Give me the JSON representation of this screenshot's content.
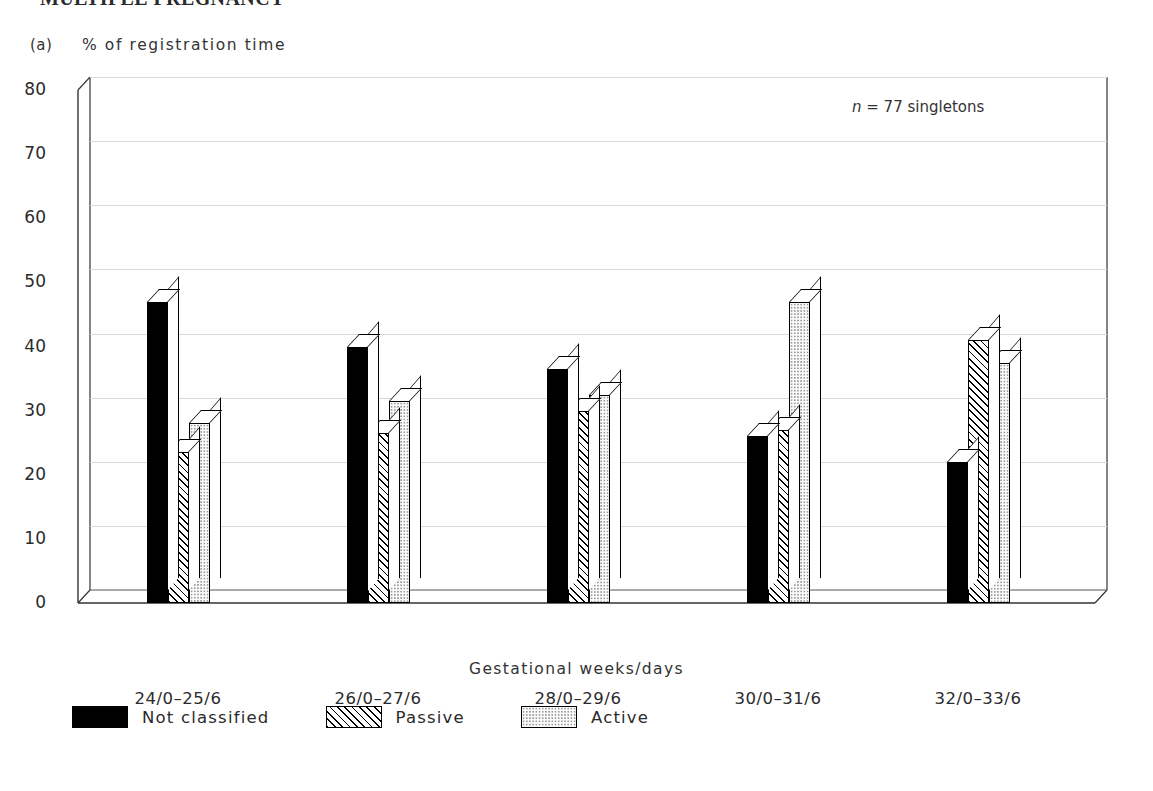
{
  "running_head": "MULTIPLE PREGNANCY",
  "panel_label": "(a)",
  "annotation": {
    "symbol": "n",
    "rest": " = 77 singletons"
  },
  "legend": {
    "items": [
      {
        "label": "Not classified",
        "pattern": "solid-black"
      },
      {
        "label": "Passive",
        "pattern": "diagonal-hatch"
      },
      {
        "label": "Active",
        "pattern": "light-dotted"
      }
    ]
  },
  "chart_data": {
    "type": "bar",
    "title": "",
    "subtitle": "",
    "xlabel": "Gestational weeks/days",
    "ylabel": "% of registration time",
    "ylim": [
      0,
      80
    ],
    "yticks": [
      0,
      10,
      20,
      30,
      40,
      50,
      60,
      70,
      80
    ],
    "grid": true,
    "legend_position": "below-plot-left",
    "annotation": "n = 77 singletons",
    "categories": [
      "24/0–25/6",
      "26/0–27/6",
      "28/0–29/6",
      "30/0–31/6",
      "32/0–33/6"
    ],
    "series": [
      {
        "name": "Not classified",
        "values": [
          47,
          40,
          36.5,
          26,
          22
        ]
      },
      {
        "name": "Passive",
        "values": [
          23.5,
          26.5,
          30,
          27,
          41
        ]
      },
      {
        "name": "Active",
        "values": [
          28,
          31.5,
          32.5,
          47,
          37.5
        ]
      }
    ]
  }
}
